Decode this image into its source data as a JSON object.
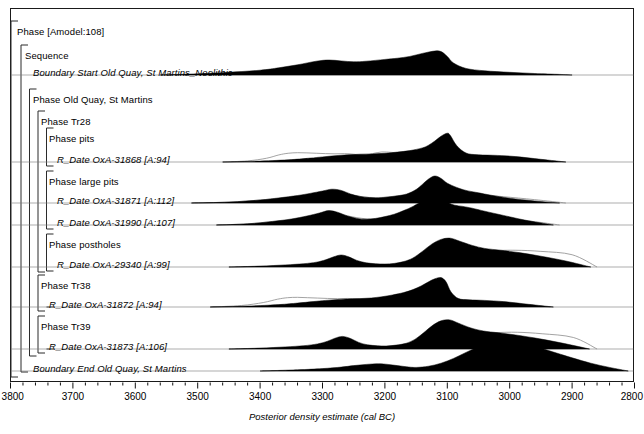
{
  "figure": {
    "axis_title": "Posterior density estimate (cal BC)",
    "x_axis": {
      "min": 3800,
      "max": 2800,
      "direction": "decreasing-left-to-right",
      "major_ticks": [
        3800,
        3700,
        3600,
        3500,
        3400,
        3300,
        3200,
        3100,
        3000,
        2900,
        2800
      ],
      "minor_tick_interval": 20,
      "tick_labels": [
        "3800",
        "3700",
        "3600",
        "3500",
        "3400",
        "3300",
        "3200",
        "3100",
        "3000",
        "2900",
        "2800"
      ]
    },
    "rows": [
      {
        "id": "phase-amodel",
        "label": "Phase [Amodel:108]",
        "type": "phase",
        "depth": 0,
        "italic": false,
        "y": 27
      },
      {
        "id": "sequence",
        "label": "Sequence",
        "type": "sequence",
        "depth": 1,
        "italic": false,
        "y": 51
      },
      {
        "id": "boundary-start",
        "label": "Boundary Start Old Quay, St Martins_Neolithic",
        "type": "boundary",
        "depth": 2,
        "italic": true,
        "y": 68
      },
      {
        "id": "phase-old-quay",
        "label": "Phase Old Quay, St Martins",
        "type": "phase",
        "depth": 2,
        "italic": false,
        "y": 95
      },
      {
        "id": "phase-tr28",
        "label": "Phase Tr28",
        "type": "phase",
        "depth": 3,
        "italic": false,
        "y": 117
      },
      {
        "id": "phase-pits",
        "label": "Phase pits",
        "type": "phase",
        "depth": 4,
        "italic": false,
        "y": 134
      },
      {
        "id": "oxa-31868",
        "label": "R_Date OxA-31868 [A:94]",
        "type": "r_date",
        "depth": 5,
        "italic": true,
        "y": 155
      },
      {
        "id": "phase-large-pits",
        "label": "Phase large pits",
        "type": "phase",
        "depth": 4,
        "italic": false,
        "y": 177
      },
      {
        "id": "oxa-31871",
        "label": "R_Date OxA-31871 [A:112]",
        "type": "r_date",
        "depth": 5,
        "italic": true,
        "y": 196
      },
      {
        "id": "oxa-31990",
        "label": "R_Date OxA-31990 [A:107]",
        "type": "r_date",
        "depth": 5,
        "italic": true,
        "y": 218
      },
      {
        "id": "phase-postholes",
        "label": "Phase postholes",
        "type": "phase",
        "depth": 4,
        "italic": false,
        "y": 240
      },
      {
        "id": "oxa-29340",
        "label": "R_Date OxA-29340 [A:99]",
        "type": "r_date",
        "depth": 5,
        "italic": true,
        "y": 260
      },
      {
        "id": "phase-tr38",
        "label": "Phase Tr38",
        "type": "phase",
        "depth": 3,
        "italic": false,
        "y": 281
      },
      {
        "id": "oxa-31872",
        "label": "R_Date OxA-31872 [A:94]",
        "type": "r_date",
        "depth": 4,
        "italic": true,
        "y": 300
      },
      {
        "id": "phase-tr39",
        "label": "Phase Tr39",
        "type": "phase",
        "depth": 3,
        "italic": false,
        "y": 322
      },
      {
        "id": "oxa-31873",
        "label": "R_Date OxA-31873 [A:106]",
        "type": "r_date",
        "depth": 4,
        "italic": true,
        "y": 342
      },
      {
        "id": "boundary-end",
        "label": "Boundary End Old Quay, St Martins",
        "type": "boundary",
        "depth": 2,
        "italic": true,
        "y": 364
      }
    ],
    "colors": {
      "posterior_fill": "#000000",
      "prior_outline": "#8c8c8c",
      "frame": "#1a1a1a",
      "background": "#ffffff"
    }
  },
  "chart_data": {
    "type": "area",
    "title": "",
    "xlabel": "Posterior density estimate (cal BC)",
    "ylabel": "",
    "xlim": [
      3800,
      2800
    ],
    "grid": false,
    "legend": "none",
    "note": "OxCal multi-plot: each row shows a calibrated radiocarbon probability distribution. Grey outline = unmodelled likelihood, solid black = modelled posterior.",
    "distributions": [
      {
        "id": "boundary-start",
        "name": "Boundary Start Old Quay, St Martins_Neolithic",
        "baseline_y": 75,
        "posterior": {
          "x": [
            3560,
            3500,
            3450,
            3400,
            3370,
            3340,
            3310,
            3290,
            3270,
            3250,
            3230,
            3200,
            3180,
            3160,
            3140,
            3120,
            3110,
            3100,
            3090,
            3070,
            3040,
            3000,
            2960,
            2920,
            2900
          ],
          "y": [
            0.0,
            0.04,
            0.09,
            0.16,
            0.24,
            0.34,
            0.46,
            0.5,
            0.47,
            0.44,
            0.46,
            0.52,
            0.56,
            0.62,
            0.72,
            0.8,
            0.78,
            0.62,
            0.4,
            0.22,
            0.14,
            0.09,
            0.05,
            0.02,
            0.0
          ]
        },
        "prior": null
      },
      {
        "id": "oxa-31868",
        "name": "R_Date OxA-31868 [A:94]",
        "baseline_y": 162,
        "posterior": {
          "x": [
            3460,
            3400,
            3350,
            3320,
            3300,
            3280,
            3260,
            3240,
            3220,
            3200,
            3180,
            3160,
            3140,
            3130,
            3120,
            3110,
            3100,
            3095,
            3085,
            3070,
            3050,
            3020,
            2990,
            2950,
            2910
          ],
          "y": [
            0.0,
            0.03,
            0.08,
            0.13,
            0.17,
            0.21,
            0.24,
            0.26,
            0.27,
            0.29,
            0.33,
            0.38,
            0.47,
            0.56,
            0.7,
            0.86,
            0.96,
            0.88,
            0.55,
            0.3,
            0.24,
            0.22,
            0.18,
            0.09,
            0.0
          ]
        },
        "prior": {
          "x": [
            3460,
            3420,
            3390,
            3370,
            3355,
            3340,
            3325,
            3310,
            3295,
            3280,
            3265,
            3250,
            3235,
            3220,
            3205,
            3190,
            3175,
            3160,
            3145,
            3130,
            3115,
            3100,
            3085,
            3070,
            3050,
            3020,
            2980,
            2930
          ],
          "y": [
            0.0,
            0.06,
            0.2,
            0.38,
            0.47,
            0.5,
            0.49,
            0.47,
            0.45,
            0.44,
            0.45,
            0.42,
            0.33,
            0.45,
            0.54,
            0.52,
            0.49,
            0.52,
            0.54,
            0.5,
            0.47,
            0.45,
            0.4,
            0.3,
            0.22,
            0.18,
            0.12,
            0.0
          ]
        }
      },
      {
        "id": "oxa-31871",
        "name": "R_Date OxA-31871 [A:112]",
        "baseline_y": 203,
        "posterior": {
          "x": [
            3510,
            3450,
            3400,
            3370,
            3340,
            3320,
            3300,
            3285,
            3270,
            3255,
            3240,
            3225,
            3210,
            3195,
            3180,
            3165,
            3150,
            3140,
            3130,
            3120,
            3110,
            3100,
            3085,
            3070,
            3050,
            3030,
            3000,
            2960,
            2920
          ],
          "y": [
            0.0,
            0.03,
            0.1,
            0.17,
            0.25,
            0.32,
            0.4,
            0.46,
            0.42,
            0.3,
            0.22,
            0.18,
            0.17,
            0.2,
            0.24,
            0.3,
            0.45,
            0.62,
            0.8,
            0.9,
            0.82,
            0.66,
            0.52,
            0.42,
            0.34,
            0.26,
            0.16,
            0.07,
            0.0
          ]
        },
        "prior": {
          "x": [
            3510,
            3450,
            3400,
            3360,
            3330,
            3305,
            3285,
            3265,
            3245,
            3225,
            3205,
            3185,
            3165,
            3150,
            3135,
            3120,
            3105,
            3090,
            3070,
            3045,
            3010,
            2960,
            2910
          ],
          "y": [
            0.0,
            0.05,
            0.16,
            0.28,
            0.38,
            0.52,
            0.58,
            0.5,
            0.38,
            0.3,
            0.3,
            0.35,
            0.44,
            0.52,
            0.6,
            0.66,
            0.62,
            0.56,
            0.5,
            0.44,
            0.34,
            0.18,
            0.0
          ]
        }
      },
      {
        "id": "oxa-31990",
        "name": "R_Date OxA-31990 [A:107]",
        "baseline_y": 225,
        "posterior": {
          "x": [
            3470,
            3420,
            3380,
            3350,
            3325,
            3305,
            3290,
            3275,
            3260,
            3245,
            3230,
            3215,
            3200,
            3185,
            3170,
            3155,
            3140,
            3128,
            3118,
            3108,
            3098,
            3088,
            3075,
            3060,
            3040,
            3010,
            2970,
            2930
          ],
          "y": [
            0.0,
            0.04,
            0.12,
            0.2,
            0.3,
            0.4,
            0.48,
            0.42,
            0.3,
            0.22,
            0.19,
            0.22,
            0.28,
            0.36,
            0.48,
            0.62,
            0.8,
            0.92,
            0.98,
            0.9,
            0.74,
            0.66,
            0.62,
            0.56,
            0.46,
            0.32,
            0.14,
            0.0
          ]
        },
        "prior": {
          "x": [
            3470,
            3420,
            3380,
            3345,
            3320,
            3300,
            3282,
            3264,
            3246,
            3228,
            3210,
            3192,
            3174,
            3156,
            3140,
            3124,
            3108,
            3092,
            3074,
            3050,
            3015,
            2965,
            2920
          ],
          "y": [
            0.0,
            0.06,
            0.18,
            0.3,
            0.42,
            0.55,
            0.6,
            0.52,
            0.4,
            0.33,
            0.34,
            0.4,
            0.5,
            0.58,
            0.66,
            0.72,
            0.68,
            0.62,
            0.56,
            0.5,
            0.38,
            0.2,
            0.0
          ]
        }
      },
      {
        "id": "oxa-29340",
        "name": "R_Date OxA-29340 [A:99]",
        "baseline_y": 267,
        "posterior": {
          "x": [
            3450,
            3400,
            3360,
            3330,
            3310,
            3295,
            3282,
            3270,
            3258,
            3245,
            3230,
            3215,
            3200,
            3185,
            3170,
            3155,
            3140,
            3125,
            3110,
            3095,
            3080,
            3060,
            3040,
            3015,
            2985,
            2950,
            2910,
            2870
          ],
          "y": [
            0.0,
            0.03,
            0.07,
            0.11,
            0.16,
            0.24,
            0.34,
            0.4,
            0.34,
            0.22,
            0.14,
            0.11,
            0.1,
            0.12,
            0.18,
            0.3,
            0.52,
            0.76,
            0.92,
            0.96,
            0.86,
            0.72,
            0.62,
            0.56,
            0.48,
            0.36,
            0.2,
            0.0
          ]
        },
        "prior": {
          "x": [
            3450,
            3390,
            3340,
            3305,
            3280,
            3260,
            3240,
            3220,
            3200,
            3180,
            3160,
            3140,
            3120,
            3100,
            3080,
            3055,
            3025,
            2990,
            2950,
            2900,
            2860
          ],
          "y": [
            0.0,
            0.04,
            0.1,
            0.16,
            0.22,
            0.26,
            0.2,
            0.14,
            0.13,
            0.18,
            0.28,
            0.44,
            0.62,
            0.74,
            0.78,
            0.82,
            0.88,
            0.9,
            0.84,
            0.66,
            0.0
          ]
        }
      },
      {
        "id": "oxa-31872",
        "name": "R_Date OxA-31872 [A:94]",
        "baseline_y": 307,
        "posterior": {
          "x": [
            3480,
            3420,
            3370,
            3340,
            3315,
            3295,
            3275,
            3258,
            3240,
            3222,
            3205,
            3188,
            3170,
            3155,
            3142,
            3130,
            3120,
            3110,
            3102,
            3094,
            3082,
            3065,
            3040,
            3010,
            2970,
            2930
          ],
          "y": [
            0.0,
            0.03,
            0.08,
            0.13,
            0.18,
            0.22,
            0.25,
            0.27,
            0.28,
            0.3,
            0.34,
            0.4,
            0.48,
            0.58,
            0.7,
            0.84,
            0.94,
            0.98,
            0.84,
            0.5,
            0.28,
            0.24,
            0.22,
            0.18,
            0.09,
            0.0
          ]
        },
        "prior": {
          "x": [
            3480,
            3430,
            3395,
            3372,
            3356,
            3340,
            3324,
            3308,
            3292,
            3276,
            3260,
            3244,
            3228,
            3212,
            3196,
            3180,
            3164,
            3148,
            3132,
            3116,
            3100,
            3084,
            3062,
            3030,
            2985,
            2935
          ],
          "y": [
            0.0,
            0.08,
            0.24,
            0.42,
            0.5,
            0.52,
            0.5,
            0.48,
            0.46,
            0.45,
            0.46,
            0.43,
            0.34,
            0.46,
            0.55,
            0.53,
            0.5,
            0.53,
            0.55,
            0.51,
            0.48,
            0.43,
            0.32,
            0.22,
            0.14,
            0.0
          ]
        }
      },
      {
        "id": "oxa-31873",
        "name": "R_Date OxA-31873 [A:106]",
        "baseline_y": 349,
        "posterior": {
          "x": [
            3450,
            3400,
            3360,
            3330,
            3308,
            3292,
            3280,
            3268,
            3255,
            3242,
            3228,
            3212,
            3198,
            3182,
            3166,
            3152,
            3138,
            3124,
            3110,
            3096,
            3082,
            3062,
            3042,
            3018,
            2988,
            2952,
            2912,
            2872
          ],
          "y": [
            0.0,
            0.03,
            0.07,
            0.11,
            0.17,
            0.26,
            0.36,
            0.42,
            0.35,
            0.22,
            0.14,
            0.11,
            0.1,
            0.13,
            0.19,
            0.32,
            0.54,
            0.78,
            0.94,
            0.97,
            0.86,
            0.7,
            0.6,
            0.54,
            0.46,
            0.34,
            0.18,
            0.0
          ]
        },
        "prior": {
          "x": [
            3450,
            3390,
            3340,
            3305,
            3280,
            3258,
            3238,
            3218,
            3198,
            3178,
            3158,
            3138,
            3118,
            3098,
            3078,
            3052,
            3022,
            2988,
            2948,
            2898,
            2860
          ],
          "y": [
            0.0,
            0.04,
            0.1,
            0.16,
            0.22,
            0.26,
            0.2,
            0.14,
            0.13,
            0.18,
            0.28,
            0.45,
            0.62,
            0.74,
            0.78,
            0.82,
            0.88,
            0.9,
            0.82,
            0.62,
            0.0
          ]
        }
      },
      {
        "id": "boundary-end",
        "name": "Boundary End Old Quay, St Martins",
        "baseline_y": 371,
        "posterior": {
          "x": [
            3400,
            3340,
            3300,
            3270,
            3250,
            3230,
            3210,
            3195,
            3180,
            3165,
            3150,
            3130,
            3110,
            3090,
            3070,
            3050,
            3030,
            3010,
            2990,
            2970,
            2950,
            2925,
            2900,
            2870,
            2840,
            2810
          ],
          "y": [
            0.0,
            0.04,
            0.08,
            0.13,
            0.18,
            0.22,
            0.24,
            0.22,
            0.18,
            0.14,
            0.12,
            0.16,
            0.26,
            0.42,
            0.62,
            0.8,
            0.92,
            0.98,
            0.96,
            0.88,
            0.76,
            0.6,
            0.44,
            0.26,
            0.12,
            0.0
          ]
        },
        "prior": null
      }
    ]
  }
}
